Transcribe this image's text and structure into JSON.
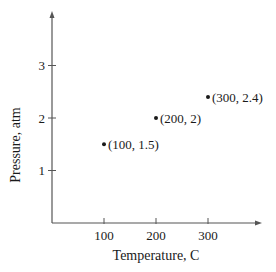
{
  "chart_data": {
    "type": "scatter",
    "title": "",
    "xlabel": "Temperature, C",
    "ylabel": "Pressure, atm",
    "x_ticks": [
      100,
      200,
      300
    ],
    "y_ticks": [
      1,
      2,
      3
    ],
    "xlim": [
      0,
      380
    ],
    "ylim": [
      0,
      3.8
    ],
    "grid": false,
    "legend": null,
    "series": [
      {
        "name": "points",
        "x": [
          100,
          200,
          300
        ],
        "y": [
          1.5,
          2,
          2.4
        ],
        "labels": [
          "(100, 1.5)",
          "(200, 2)",
          "(300, 2.4)"
        ]
      }
    ]
  },
  "colors": {
    "axis": "#555555",
    "point": "#1a1a1a",
    "text": "#1a1a1a"
  }
}
